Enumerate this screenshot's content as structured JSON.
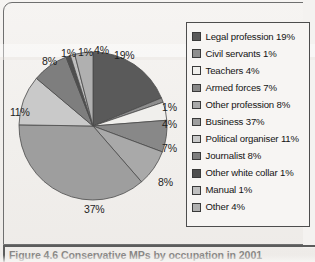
{
  "figure": {
    "caption": "Figure 4.6 Conservative MPs by occupation in 2001",
    "frame_color": "#6f6f6f",
    "paper_color": "#f4f2f0"
  },
  "chart_data": {
    "type": "pie",
    "title": "Conservative MPs by occupation in 2001",
    "xlabel": "",
    "ylabel": "",
    "grid": false,
    "legend_position": "right",
    "start_angle_oclock": 12,
    "direction": "clockwise",
    "total_percent": 101,
    "categories": [
      "Legal profession",
      "Civil servants",
      "Teachers",
      "Armed forces",
      "Other profession",
      "Business",
      "Political organiser",
      "Journalist",
      "Other white collar",
      "Manual",
      "Other"
    ],
    "values": [
      19,
      1,
      4,
      7,
      8,
      37,
      11,
      8,
      1,
      1,
      4
    ],
    "value_labels": [
      "19%",
      "1%",
      "4%",
      "7%",
      "8%",
      "37%",
      "11%",
      "8%",
      "1%",
      "1%",
      "4%"
    ],
    "colors": [
      "#5a5a5a",
      "#8e8e8e",
      "#f0efec",
      "#888888",
      "#a9a9a9",
      "#9e9e9e",
      "#c9c9c9",
      "#7e7e7e",
      "#4f4f4f",
      "#bfbfbf",
      "#b0b0b0"
    ],
    "slice_label_positions": [
      {
        "label": "19%",
        "left": 108,
        "top": 35
      },
      {
        "label": "1%",
        "left": 156,
        "top": 87
      },
      {
        "label": "4%",
        "left": 156,
        "top": 104
      },
      {
        "label": "7%",
        "left": 156,
        "top": 128
      },
      {
        "label": "8%",
        "left": 152,
        "top": 162
      },
      {
        "label": "37%",
        "left": 78,
        "top": 189
      },
      {
        "label": "11%",
        "left": 4,
        "top": 92
      },
      {
        "label": "8%",
        "left": 36,
        "top": 41
      },
      {
        "label": "1%",
        "left": 55,
        "top": 33
      },
      {
        "label": "1%",
        "left": 72,
        "top": 32
      },
      {
        "label": "4%",
        "left": 88,
        "top": 30
      }
    ]
  },
  "legend": {
    "border_color": "#4d4d4d",
    "items": [
      {
        "label": "Legal profession 19%",
        "color": "#5a5a5a"
      },
      {
        "label": "Civil servants 1%",
        "color": "#8e8e8e"
      },
      {
        "label": "Teachers 4%",
        "color": "#f0efec"
      },
      {
        "label": "Armed forces 7%",
        "color": "#888888"
      },
      {
        "label": "Other profession 8%",
        "color": "#a9a9a9"
      },
      {
        "label": "Business 37%",
        "color": "#9e9e9e"
      },
      {
        "label": "Political organiser 11%",
        "color": "#c9c9c9"
      },
      {
        "label": "Journalist 8%",
        "color": "#7e7e7e"
      },
      {
        "label": "Other white collar 1%",
        "color": "#4f4f4f"
      },
      {
        "label": "Manual 1%",
        "color": "#bfbfbf"
      },
      {
        "label": "Other 4%",
        "color": "#b0b0b0"
      }
    ]
  }
}
